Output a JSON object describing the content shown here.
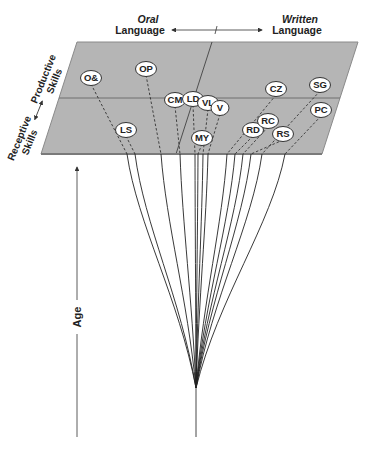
{
  "header": {
    "left_label_line1": "Oral",
    "left_label_line2": "Language",
    "right_label_line1": "Written",
    "right_label_line2": "Language"
  },
  "side_axis": {
    "top_label_line1": "Productive",
    "top_label_line2": "Skills",
    "bottom_label_line1": "Receptive",
    "bottom_label_line2": "Skills"
  },
  "age_axis": {
    "label": "Age"
  },
  "colors": {
    "plane_fill": "#b5b5b5",
    "plane_edge": "#7a7a7a",
    "line": "#222222",
    "node_fill": "#ffffff"
  },
  "nodes": [
    {
      "id": "O&",
      "label": "O&",
      "x": 91,
      "y": 78,
      "exit_x": 127
    },
    {
      "id": "OP",
      "label": "OP",
      "x": 146,
      "y": 69,
      "exit_x": 161
    },
    {
      "id": "CM",
      "label": "CM",
      "x": 175,
      "y": 100,
      "exit_x": 180
    },
    {
      "id": "LD",
      "label": "LD",
      "x": 193,
      "y": 99,
      "exit_x": 195
    },
    {
      "id": "VL",
      "label": "VL",
      "x": 208,
      "y": 103,
      "exit_x": 203
    },
    {
      "id": "V",
      "label": "V",
      "x": 220,
      "y": 108,
      "exit_x": 208
    },
    {
      "id": "LS",
      "label": "LS",
      "x": 126,
      "y": 130,
      "exit_x": 135
    },
    {
      "id": "MY",
      "label": "MY",
      "x": 202,
      "y": 138,
      "exit_x": 198
    },
    {
      "id": "CZ",
      "label": "CZ",
      "x": 276,
      "y": 89,
      "exit_x": 227
    },
    {
      "id": "SG",
      "label": "SG",
      "x": 320,
      "y": 85,
      "exit_x": 262
    },
    {
      "id": "RD",
      "label": "RD",
      "x": 253,
      "y": 130,
      "exit_x": 235
    },
    {
      "id": "RC",
      "label": "RC",
      "x": 268,
      "y": 121,
      "exit_x": 243
    },
    {
      "id": "RS",
      "label": "RS",
      "x": 283,
      "y": 134,
      "exit_x": 251
    },
    {
      "id": "PC",
      "label": "PC",
      "x": 321,
      "y": 110,
      "exit_x": 285
    }
  ]
}
